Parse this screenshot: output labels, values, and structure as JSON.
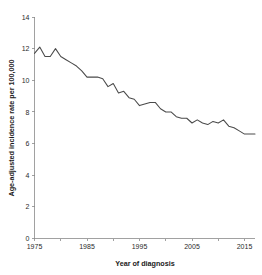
{
  "chart_data": {
    "type": "line",
    "title": "",
    "xlabel": "Year of diagnosis",
    "ylabel": "Age-adjusted incidence rate per 100,000",
    "xlim": [
      1975,
      2017
    ],
    "ylim": [
      0,
      14
    ],
    "xticks": [
      1975,
      1985,
      1995,
      2005,
      2015
    ],
    "xtick_labels": [
      "1975",
      "1985",
      "1995",
      "2005",
      "2015"
    ],
    "x_minor_tick_step": 5,
    "yticks": [
      0,
      2,
      4,
      6,
      8,
      10,
      12,
      14
    ],
    "ytick_labels": [
      "0",
      "2",
      "4",
      "6",
      "8",
      "10",
      "12",
      "14"
    ],
    "grid": false,
    "legend": null,
    "line_color": "#4a4a4a",
    "background_color": "#ffffff",
    "axis_color": "#8a8a8a",
    "series": [
      {
        "name": "Age-adjusted incidence rate",
        "x": [
          1975,
          1976,
          1977,
          1978,
          1979,
          1980,
          1981,
          1982,
          1983,
          1984,
          1985,
          1986,
          1987,
          1988,
          1989,
          1990,
          1991,
          1992,
          1993,
          1994,
          1995,
          1996,
          1997,
          1998,
          1999,
          2000,
          2001,
          2002,
          2003,
          2004,
          2005,
          2006,
          2007,
          2008,
          2009,
          2010,
          2011,
          2012,
          2013,
          2014,
          2015,
          2016,
          2017
        ],
        "values": [
          11.7,
          12.1,
          11.5,
          11.5,
          12.0,
          11.5,
          11.3,
          11.1,
          10.9,
          10.6,
          10.2,
          10.2,
          10.2,
          10.1,
          9.6,
          9.8,
          9.2,
          9.3,
          8.9,
          8.8,
          8.4,
          8.5,
          8.6,
          8.6,
          8.2,
          8.0,
          8.0,
          7.7,
          7.6,
          7.6,
          7.3,
          7.5,
          7.3,
          7.2,
          7.4,
          7.3,
          7.5,
          7.1,
          7.0,
          6.8,
          6.6,
          6.6,
          6.6
        ]
      }
    ]
  }
}
